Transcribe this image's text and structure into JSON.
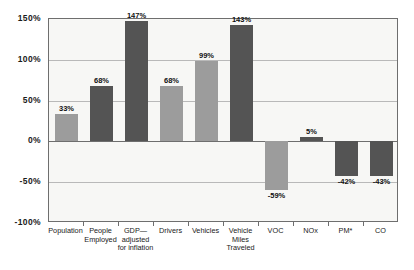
{
  "chart_data": {
    "type": "bar",
    "title": "",
    "subtitle": "",
    "xlabel": "",
    "ylabel": "",
    "ylim": [
      -100,
      150
    ],
    "grid": true,
    "legend": "none",
    "y_ticks": [
      "150%",
      "100%",
      "50%",
      "0%",
      "-50%",
      "-100%"
    ],
    "y_tick_values": [
      150,
      100,
      50,
      0,
      -50,
      -100
    ],
    "categories": [
      "Population",
      "People\nEmployed",
      "GDP—\nadjusted\nfor inflation",
      "Drivers",
      "Vehicles",
      "Vehicle\nMiles\nTraveled",
      "VOC",
      "NOx",
      "PM*",
      "CO"
    ],
    "values": [
      33,
      68,
      147,
      68,
      99,
      143,
      -59,
      5,
      -42,
      -43
    ],
    "data_labels": [
      "33%",
      "68%",
      "147%",
      "68%",
      "99%",
      "143%",
      "-59%",
      "5%",
      "-42%",
      "-43%"
    ],
    "bar_colors": [
      "#9c9c9c",
      "#545454",
      "#545454",
      "#9c9c9c",
      "#9c9c9c",
      "#545454",
      "#9c9c9c",
      "#545454",
      "#545454",
      "#545454"
    ],
    "bar_shades": [
      "light",
      "dark",
      "dark",
      "light",
      "light",
      "dark",
      "light",
      "dark",
      "dark",
      "dark"
    ]
  },
  "colors": {
    "plot_background": "#f7f7f5",
    "page_background": "#ffffff",
    "gridline": "#b9b9b9",
    "axis": "#6e6e6e",
    "bar_light": "#9c9c9c",
    "bar_dark": "#545454",
    "text": "#1a1a1a"
  }
}
